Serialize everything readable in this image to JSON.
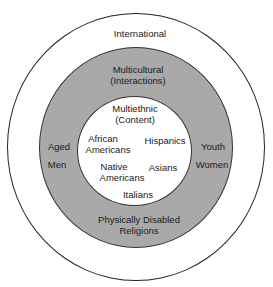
{
  "diagram": {
    "type": "concentric-circles",
    "colors": {
      "outer_fill": "#ffffff",
      "middle_fill": "#a9a9a9",
      "inner_fill": "#ffffff",
      "stroke": "#222222"
    },
    "outer": {
      "title": "International"
    },
    "middle": {
      "title_line1": "Multicultural",
      "title_line2": "(Interactions)",
      "left": [
        "Aged",
        "Men"
      ],
      "right": [
        "Youth",
        "Women"
      ],
      "bottom_line1": "Physically Disabled",
      "bottom_line2": "Religions"
    },
    "inner": {
      "title_line1": "Multiethnic",
      "title_line2": "(Content)",
      "groups": [
        {
          "line1": "African",
          "line2": "Americans"
        },
        {
          "line1": "Hispanics"
        },
        {
          "line1": "Native",
          "line2": "Americans"
        },
        {
          "line1": "Asians"
        },
        {
          "line1": "Italians"
        }
      ]
    }
  }
}
